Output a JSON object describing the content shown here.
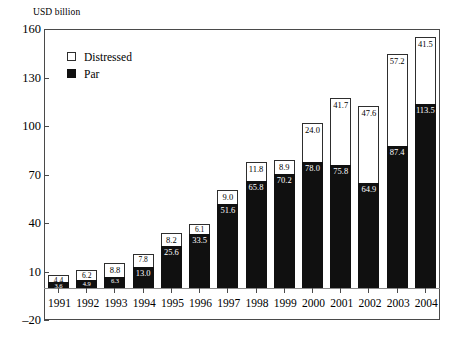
{
  "chart_data": {
    "type": "bar",
    "subtype": "stacked-bar",
    "title": "",
    "xlabel": "",
    "ylabel": "USD billion",
    "ylim": [
      -20,
      160
    ],
    "yticks": [
      160,
      130,
      100,
      70,
      40,
      10,
      -20
    ],
    "ytick_labels": [
      "160",
      "130",
      "100",
      "70",
      "40",
      "10",
      "–20"
    ],
    "grid": false,
    "legend_position": "upper-left-inside",
    "categories": [
      "1991",
      "1992",
      "1993",
      "1994",
      "1995",
      "1996",
      "1997",
      "1998",
      "1999",
      "2000",
      "2001",
      "2002",
      "2003",
      "2004"
    ],
    "series": [
      {
        "name": "Par",
        "color": "#101010",
        "values": [
          3.6,
          4.9,
          6.3,
          13.0,
          25.6,
          33.5,
          51.6,
          65.8,
          70.2,
          78.0,
          75.8,
          64.9,
          87.4,
          113.5
        ],
        "labels": [
          "3.6",
          "4.9",
          "6.3",
          "13.0",
          "25.6",
          "33.5",
          "51.6",
          "65.8",
          "70.2",
          "78.0",
          "75.8",
          "64.9",
          "87.4",
          "113.5"
        ]
      },
      {
        "name": "Distressed",
        "color": "#ffffff",
        "values": [
          4.4,
          6.2,
          8.8,
          7.8,
          8.2,
          6.1,
          9.0,
          11.8,
          8.9,
          24.0,
          41.7,
          47.6,
          57.2,
          41.5
        ],
        "labels": [
          "4.4",
          "6.2",
          "8.8",
          "7.8",
          "8.2",
          "6.1",
          "9.0",
          "11.8",
          "8.9",
          "24.0",
          "41.7",
          "47.6",
          "57.2",
          "41.5"
        ]
      }
    ],
    "totals": [
      8.0,
      11.1,
      15.1,
      20.8,
      33.8,
      39.6,
      60.6,
      77.6,
      79.1,
      102.0,
      117.5,
      112.5,
      144.6,
      155.0
    ]
  },
  "legend": {
    "items": [
      {
        "label": "Distressed",
        "swatch": "white-square"
      },
      {
        "label": "Par",
        "swatch": "black-square"
      }
    ]
  }
}
